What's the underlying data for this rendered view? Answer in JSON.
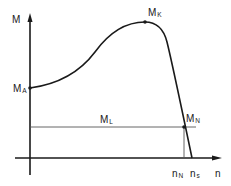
{
  "diagram": {
    "type": "torque-speed characteristic",
    "axes": {
      "y": {
        "label": "M"
      },
      "x": {
        "label": "n"
      }
    },
    "points": {
      "start_torque": {
        "main": "M",
        "sub": "A"
      },
      "breakdown_torque": {
        "main": "M",
        "sub": "K"
      },
      "rated_torque": {
        "main": "M",
        "sub": "N"
      },
      "load_torque": {
        "main": "M",
        "sub": "L"
      }
    },
    "x_ticks": {
      "rated_speed": {
        "main": "n",
        "sub": "N"
      },
      "sync_speed": {
        "main": "n",
        "sub": "s"
      }
    },
    "colors": {
      "stroke": "#1a1a1a",
      "background": "#ffffff"
    }
  }
}
